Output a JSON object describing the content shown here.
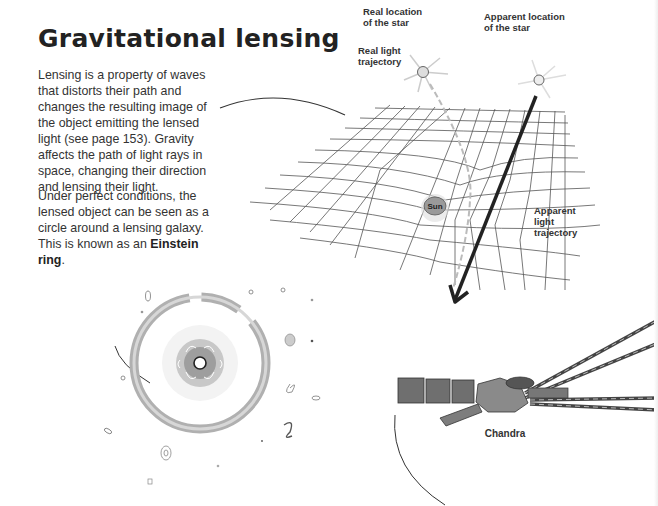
{
  "page": {
    "title": "Gravitational lensing",
    "paragraphs": {
      "p1": "Lensing is a property of waves that distorts their path and changes the resulting image of the object emitting the lensed light (see page 153). Gravity affects the path of light rays in space, changing their direction and lensing their light.",
      "p2_before": "Under perfect conditions, the lensed object can be seen as a circle around a lensing galaxy. This is known as an ",
      "p2_bold": "Einstein ring",
      "p2_after": "."
    }
  },
  "diagram": {
    "labels": {
      "real_location": "Real location\nof the star",
      "apparent_location": "Apparent location\nof the star",
      "real_trajectory": "Real light\ntrajectory",
      "apparent_trajectory": "Apparent\nlight\ntrajectory",
      "sun": "Sun"
    }
  },
  "illustrations": {
    "einstein_ring": "Einstein ring",
    "telescope_label": "Chandra"
  }
}
